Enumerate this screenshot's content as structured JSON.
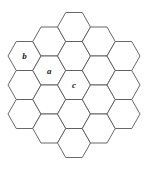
{
  "figure": {
    "background_color": "#ffffff",
    "stroke_color": "#58585a",
    "fill_color": "#ffffff",
    "label_color": "#1b1b1b",
    "stroke_width": 0.9
  },
  "chart_data": {
    "type": "diagram",
    "title": "",
    "xlabel": "",
    "ylabel": "",
    "grid": false,
    "legend": false,
    "hexagon": {
      "orientation": "flat-top",
      "width_px": 33,
      "height_px": 29,
      "columns": 5,
      "cells_per_column": [
        3,
        4,
        5,
        4,
        3
      ],
      "total_cells": 19
    },
    "categories": [
      "b",
      "a",
      "c"
    ],
    "values": [
      1,
      1,
      1
    ],
    "cells": [
      {
        "id": "c0r0",
        "col": 0,
        "row": 0,
        "cx": 24.5,
        "cy": 56.0,
        "label": "b"
      },
      {
        "id": "c0r1",
        "col": 0,
        "row": 1,
        "cx": 24.5,
        "cy": 85.0,
        "label": ""
      },
      {
        "id": "c0r2",
        "col": 0,
        "row": 2,
        "cx": 24.5,
        "cy": 114.0,
        "label": ""
      },
      {
        "id": "c1r0",
        "col": 1,
        "row": 0,
        "cx": 49.25,
        "cy": 41.5,
        "label": ""
      },
      {
        "id": "c1r1",
        "col": 1,
        "row": 1,
        "cx": 49.25,
        "cy": 70.5,
        "label": "a"
      },
      {
        "id": "c1r2",
        "col": 1,
        "row": 2,
        "cx": 49.25,
        "cy": 99.5,
        "label": ""
      },
      {
        "id": "c1r3",
        "col": 1,
        "row": 3,
        "cx": 49.25,
        "cy": 128.5,
        "label": ""
      },
      {
        "id": "c2r0",
        "col": 2,
        "row": 0,
        "cx": 74.0,
        "cy": 27.0,
        "label": ""
      },
      {
        "id": "c2r1",
        "col": 2,
        "row": 1,
        "cx": 74.0,
        "cy": 56.0,
        "label": ""
      },
      {
        "id": "c2r2",
        "col": 2,
        "row": 2,
        "cx": 74.0,
        "cy": 85.0,
        "label": "c"
      },
      {
        "id": "c2r3",
        "col": 2,
        "row": 3,
        "cx": 74.0,
        "cy": 114.0,
        "label": ""
      },
      {
        "id": "c2r4",
        "col": 2,
        "row": 4,
        "cx": 74.0,
        "cy": 143.0,
        "label": ""
      },
      {
        "id": "c3r0",
        "col": 3,
        "row": 0,
        "cx": 98.75,
        "cy": 41.5,
        "label": ""
      },
      {
        "id": "c3r1",
        "col": 3,
        "row": 1,
        "cx": 98.75,
        "cy": 70.5,
        "label": ""
      },
      {
        "id": "c3r2",
        "col": 3,
        "row": 2,
        "cx": 98.75,
        "cy": 99.5,
        "label": ""
      },
      {
        "id": "c3r3",
        "col": 3,
        "row": 3,
        "cx": 98.75,
        "cy": 128.5,
        "label": ""
      },
      {
        "id": "c4r0",
        "col": 4,
        "row": 0,
        "cx": 123.5,
        "cy": 56.0,
        "label": ""
      },
      {
        "id": "c4r1",
        "col": 4,
        "row": 1,
        "cx": 123.5,
        "cy": 85.0,
        "label": ""
      },
      {
        "id": "c4r2",
        "col": 4,
        "row": 2,
        "cx": 123.5,
        "cy": 114.0,
        "label": ""
      }
    ],
    "labels": [
      {
        "text": "b",
        "cx": 24.5,
        "cy": 56.0
      },
      {
        "text": "a",
        "cx": 49.25,
        "cy": 70.5
      },
      {
        "text": "c",
        "cx": 74.0,
        "cy": 85.0
      }
    ]
  }
}
